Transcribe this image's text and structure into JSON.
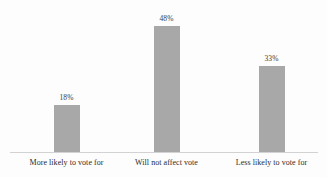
{
  "chart_data": {
    "type": "bar",
    "title": "",
    "subtitle": "",
    "xlabel": "",
    "ylabel": "",
    "categories": [
      "More likely to vote for",
      "Will not affect vote",
      "Less likely to vote for"
    ],
    "values": [
      18,
      48,
      33
    ],
    "value_labels": [
      "18%",
      "48%",
      "33%"
    ],
    "ylim": [
      0,
      58
    ],
    "grid": false,
    "legend": false,
    "legend_position": "none",
    "y_axis_visible": false,
    "x_axis_visible": true,
    "data_label_position": "above-bar"
  },
  "style": {
    "background_color": "#fdfdfd",
    "bar_color": "#a8a8a8",
    "axis_line_color": "#d2d2d2",
    "value_label_color": "#3a3a3a",
    "category_label_color": "#2b2b2b"
  }
}
